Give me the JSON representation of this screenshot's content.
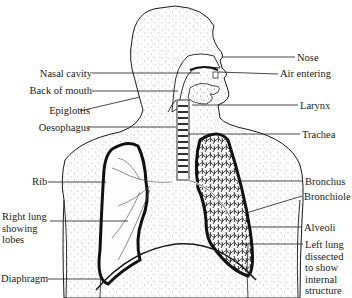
{
  "figure": {
    "type": "anatomical-diagram",
    "labels_left": [
      {
        "id": "nasal-cavity",
        "text": "Nasal cavity"
      },
      {
        "id": "back-of-mouth",
        "text": "Back of mouth"
      },
      {
        "id": "epiglottis",
        "text": "Epiglottis"
      },
      {
        "id": "oesophagus",
        "text": "Oesophagus"
      },
      {
        "id": "rib",
        "text": "Rib"
      },
      {
        "id": "right-lung",
        "lines": [
          "Right lung",
          "showing",
          "lobes"
        ]
      },
      {
        "id": "diaphragm",
        "text": "Diaphragm"
      }
    ],
    "labels_right": [
      {
        "id": "nose",
        "text": "Nose"
      },
      {
        "id": "air-entering",
        "text": "Air entering"
      },
      {
        "id": "larynx",
        "text": "Larynx"
      },
      {
        "id": "trachea",
        "text": "Trachea"
      },
      {
        "id": "bronchus",
        "text": "Bronchus"
      },
      {
        "id": "bronchiole",
        "text": "Bronchiole"
      },
      {
        "id": "alveoli",
        "text": "Alveoli"
      },
      {
        "id": "left-lung",
        "lines": [
          "Left lung",
          "dissected",
          "to show",
          "internal",
          "structure"
        ]
      }
    ],
    "colors": {
      "ink": "#1a1a1a",
      "stipple": "#555555",
      "background": "#ffffff"
    }
  }
}
